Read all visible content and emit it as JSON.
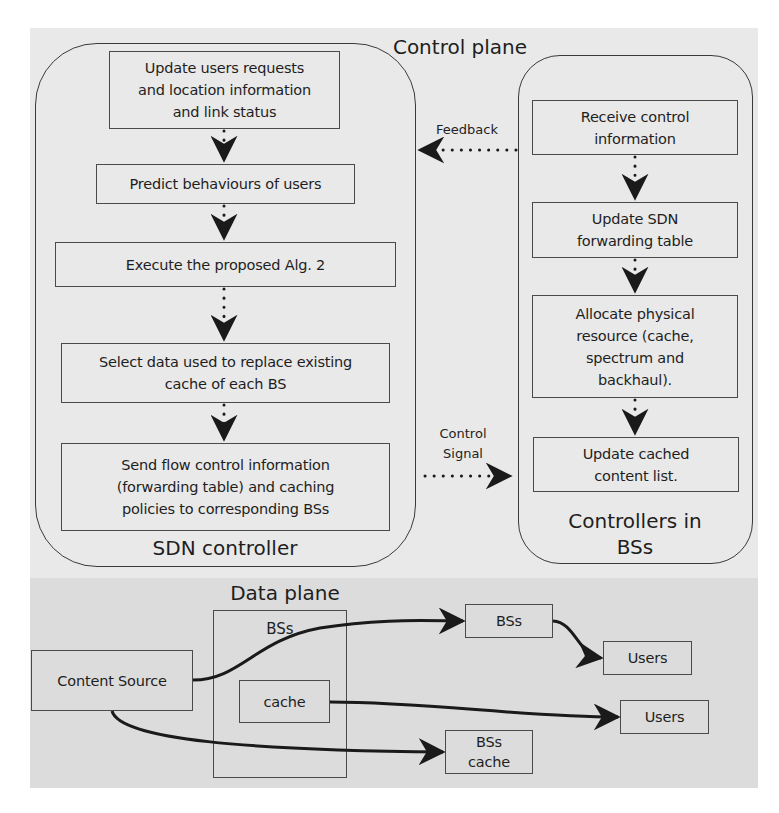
{
  "control_plane": {
    "title": "Control plane",
    "sdn_controller": {
      "label": "SDN controller",
      "steps": [
        "Update users requests\nand location information\nand link status",
        "Predict behaviours of users",
        "Execute the proposed Alg. 2",
        "Select data used to replace existing\ncache of each BS",
        "Send flow control information\n(forwarding table) and caching\npolicies to corresponding BSs"
      ]
    },
    "bs_controllers": {
      "label": "Controllers in\nBSs",
      "steps": [
        "Receive control\ninformation",
        "Update SDN\nforwarding table",
        "Allocate physical\nresource (cache,\nspectrum and\nbackhaul).",
        "Update cached\ncontent list."
      ]
    },
    "edges": {
      "feedback": "Feedback",
      "control_signal": "Control\nSignal"
    }
  },
  "data_plane": {
    "title": "Data plane",
    "nodes": {
      "content_source": "Content Source",
      "bss_group": "BSs",
      "cache": "cache",
      "bss_right": "BSs",
      "users_top": "Users",
      "users_mid": "Users",
      "bss_cache": "BSs\ncache"
    }
  },
  "colors": {
    "control_bg": "#e9e9e9",
    "data_bg": "#dcdcdc",
    "stroke": "#3a3a3a",
    "arrow": "#1a1a1a"
  }
}
